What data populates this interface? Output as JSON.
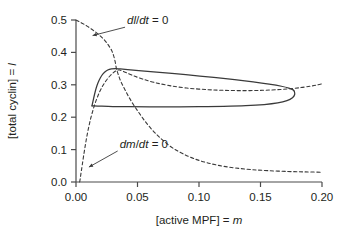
{
  "figure": {
    "background": "#ffffff",
    "ink_color": "#3a3a3a",
    "text_color": "#231f20"
  },
  "chart_data": {
    "type": "line",
    "title": "",
    "subtitle": "",
    "xlabel_parts": {
      "bracket": "[active MPF] = ",
      "symbol": "m"
    },
    "ylabel_parts": {
      "bracket": "[total cyclin] = ",
      "symbol": "l"
    },
    "xlabel": "[active MPF] = m",
    "ylabel": "[total cyclin] = l",
    "xlim": [
      0.0,
      0.2
    ],
    "ylim": [
      0.0,
      0.5
    ],
    "xticks": [
      0.0,
      0.05,
      0.1,
      0.15,
      0.2
    ],
    "xticklabels": [
      "0.00",
      "0.05",
      "0.10",
      "0.15",
      "0.20"
    ],
    "yticks": [
      0.0,
      0.1,
      0.2,
      0.3,
      0.4,
      0.5
    ],
    "yticklabels": [
      "0.0",
      "0.1",
      "0.2",
      "0.3",
      "0.4",
      "0.5"
    ],
    "grid": false,
    "legend": "none",
    "annotations": [
      {
        "id": "dl-dt-nullcline-label",
        "text": "dl/dt = 0",
        "parts": {
          "d1": "d",
          "v1": "l",
          "slash": "/",
          "d2": "d",
          "v2": "t",
          "eq": " = 0"
        },
        "x": 0.0415,
        "y": 0.487,
        "pointer_to": {
          "x": 0.0135,
          "y": 0.452
        }
      },
      {
        "id": "dm-dt-nullcline-label",
        "text": "dm/dt = 0",
        "parts": {
          "d1": "d",
          "v1": "m",
          "slash": "/",
          "d2": "d",
          "v2": "t",
          "eq": " = 0"
        },
        "x": 0.0355,
        "y": 0.105,
        "pointer_to": {
          "x": 0.0105,
          "y": 0.046
        }
      }
    ],
    "series": [
      {
        "name": "dl/dt = 0 nullcline",
        "style": "dashed",
        "points": [
          [
            0.0,
            0.5
          ],
          [
            0.003,
            0.494
          ],
          [
            0.006,
            0.488
          ],
          [
            0.009,
            0.481
          ],
          [
            0.012,
            0.4735
          ],
          [
            0.015,
            0.4655
          ],
          [
            0.018,
            0.4565
          ],
          [
            0.021,
            0.4465
          ],
          [
            0.024,
            0.434
          ],
          [
            0.0265,
            0.4215
          ],
          [
            0.029,
            0.406
          ],
          [
            0.0305,
            0.391
          ],
          [
            0.0318,
            0.372
          ],
          [
            0.0327,
            0.353
          ],
          [
            0.0333,
            0.344
          ],
          [
            0.0345,
            0.33
          ],
          [
            0.0365,
            0.31
          ],
          [
            0.0395,
            0.287
          ],
          [
            0.043,
            0.262
          ],
          [
            0.047,
            0.237
          ],
          [
            0.0515,
            0.212
          ],
          [
            0.056,
            0.188
          ],
          [
            0.061,
            0.165
          ],
          [
            0.0665,
            0.143
          ],
          [
            0.072,
            0.124
          ],
          [
            0.079,
            0.104
          ],
          [
            0.087,
            0.087
          ],
          [
            0.096,
            0.072
          ],
          [
            0.106,
            0.06
          ],
          [
            0.117,
            0.0505
          ],
          [
            0.129,
            0.0435
          ],
          [
            0.142,
            0.0385
          ],
          [
            0.156,
            0.035
          ],
          [
            0.172,
            0.0325
          ],
          [
            0.186,
            0.0312
          ],
          [
            0.2,
            0.0302
          ]
        ]
      },
      {
        "name": "dm/dt = 0 nullcline",
        "style": "dashed",
        "points": [
          [
            0.003,
            0.0
          ],
          [
            0.0036,
            0.015
          ],
          [
            0.0043,
            0.033
          ],
          [
            0.0051,
            0.053
          ],
          [
            0.006,
            0.076
          ],
          [
            0.007,
            0.1
          ],
          [
            0.0081,
            0.125
          ],
          [
            0.0093,
            0.15
          ],
          [
            0.0106,
            0.174
          ],
          [
            0.012,
            0.197
          ],
          [
            0.0136,
            0.219
          ],
          [
            0.0153,
            0.24
          ],
          [
            0.0172,
            0.26
          ],
          [
            0.0193,
            0.279
          ],
          [
            0.0216,
            0.296
          ],
          [
            0.0241,
            0.311
          ],
          [
            0.0268,
            0.324
          ],
          [
            0.0296,
            0.335
          ],
          [
            0.0324,
            0.343
          ],
          [
            0.0355,
            0.3455
          ],
          [
            0.04,
            0.339
          ],
          [
            0.046,
            0.329
          ],
          [
            0.054,
            0.318
          ],
          [
            0.064,
            0.307
          ],
          [
            0.076,
            0.2975
          ],
          [
            0.09,
            0.29
          ],
          [
            0.105,
            0.2855
          ],
          [
            0.12,
            0.283
          ],
          [
            0.136,
            0.282
          ],
          [
            0.152,
            0.283
          ],
          [
            0.166,
            0.2855
          ],
          [
            0.176,
            0.2885
          ],
          [
            0.184,
            0.292
          ],
          [
            0.191,
            0.296
          ],
          [
            0.196,
            0.2995
          ],
          [
            0.2,
            0.303
          ]
        ]
      },
      {
        "name": "limit cycle (upper branch)",
        "style": "solid",
        "points": [
          [
            0.013,
            0.235
          ],
          [
            0.0142,
            0.256
          ],
          [
            0.0155,
            0.277
          ],
          [
            0.017,
            0.297
          ],
          [
            0.0188,
            0.314
          ],
          [
            0.0208,
            0.328
          ],
          [
            0.0232,
            0.3385
          ],
          [
            0.0258,
            0.3455
          ],
          [
            0.0288,
            0.349
          ],
          [
            0.032,
            0.35
          ],
          [
            0.036,
            0.349
          ],
          [
            0.042,
            0.347
          ],
          [
            0.051,
            0.344
          ],
          [
            0.063,
            0.34
          ],
          [
            0.078,
            0.335
          ],
          [
            0.095,
            0.329
          ],
          [
            0.112,
            0.323
          ],
          [
            0.129,
            0.316
          ],
          [
            0.144,
            0.309
          ],
          [
            0.157,
            0.302
          ],
          [
            0.167,
            0.2955
          ],
          [
            0.173,
            0.29
          ],
          [
            0.1762,
            0.285
          ],
          [
            0.1775,
            0.28
          ]
        ]
      },
      {
        "name": "limit cycle (lower branch)",
        "style": "solid",
        "points": [
          [
            0.013,
            0.235
          ],
          [
            0.02,
            0.234
          ],
          [
            0.03,
            0.233
          ],
          [
            0.043,
            0.2325
          ],
          [
            0.06,
            0.2322
          ],
          [
            0.08,
            0.2322
          ],
          [
            0.1,
            0.2325
          ],
          [
            0.12,
            0.2335
          ],
          [
            0.138,
            0.2355
          ],
          [
            0.153,
            0.239
          ],
          [
            0.164,
            0.244
          ],
          [
            0.1715,
            0.251
          ],
          [
            0.176,
            0.26
          ],
          [
            0.1778,
            0.27
          ],
          [
            0.1775,
            0.28
          ]
        ]
      }
    ]
  }
}
